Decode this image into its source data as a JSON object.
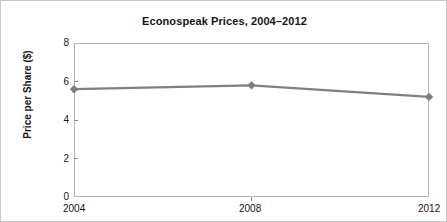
{
  "chart_data": {
    "type": "line",
    "title": "Econospeak Prices, 2004–2012",
    "xlabel": "",
    "ylabel": "Price per Share ($)",
    "x": [
      2004,
      2008,
      2012
    ],
    "x_tick_labels": [
      "2004",
      "2008",
      "2012"
    ],
    "y_tick_labels": [
      "0",
      "2",
      "4",
      "6",
      "8"
    ],
    "y_ticks": [
      0,
      2,
      4,
      6,
      8
    ],
    "ylim": [
      0,
      8
    ],
    "xlim": [
      2004,
      2012
    ],
    "grid": false,
    "legend": false,
    "series": [
      {
        "name": "Price per Share ($)",
        "values": [
          5.6,
          5.8,
          5.2
        ],
        "line_color": "#808080",
        "marker": "diamond",
        "marker_color": "#7d7d7d"
      }
    ]
  },
  "axis": {
    "y_label_0": "0",
    "y_label_1": "2",
    "y_label_2": "4",
    "y_label_3": "6",
    "y_label_4": "8",
    "x_label_0": "2004",
    "x_label_1": "2008",
    "x_label_2": "2012"
  },
  "colors": {
    "line": "#808080",
    "marker": "#7d7d7d",
    "frame": "#b5b5b5",
    "text": "#161616",
    "outer_border": "#c8c8c8"
  }
}
